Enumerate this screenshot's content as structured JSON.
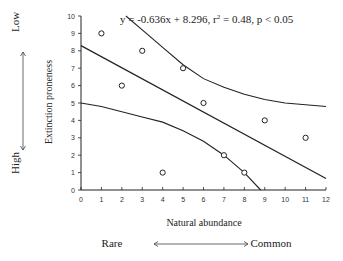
{
  "chart_data": {
    "type": "scatter",
    "title": "",
    "xlabel": "Natural abundance",
    "ylabel": "Extinction proneness",
    "xlim": [
      0,
      12
    ],
    "ylim": [
      0,
      10
    ],
    "xticks": [
      0,
      1,
      2,
      3,
      4,
      5,
      6,
      7,
      8,
      9,
      10,
      11,
      12
    ],
    "yticks": [
      0,
      1,
      2,
      3,
      4,
      5,
      6,
      7,
      8,
      9,
      10
    ],
    "grid": false,
    "points": [
      {
        "x": 1,
        "y": 9
      },
      {
        "x": 2,
        "y": 6
      },
      {
        "x": 3,
        "y": 8
      },
      {
        "x": 4,
        "y": 1
      },
      {
        "x": 5,
        "y": 7
      },
      {
        "x": 6,
        "y": 5
      },
      {
        "x": 7,
        "y": 2
      },
      {
        "x": 8,
        "y": 1
      },
      {
        "x": 9,
        "y": 4
      },
      {
        "x": 11,
        "y": 3
      }
    ],
    "regression": {
      "slope": -0.636,
      "intercept": 8.296,
      "r2": 0.48,
      "p": "< 0.05"
    },
    "confidence_upper": [
      [
        2.2,
        10
      ],
      [
        3,
        9.2
      ],
      [
        4,
        8.2
      ],
      [
        5,
        7.2
      ],
      [
        6,
        6.4
      ],
      [
        7,
        5.9
      ],
      [
        8,
        5.5
      ],
      [
        9,
        5.2
      ],
      [
        10,
        5.0
      ],
      [
        11,
        4.9
      ],
      [
        12,
        4.8
      ]
    ],
    "confidence_lower": [
      [
        0,
        5.0
      ],
      [
        1,
        4.8
      ],
      [
        2,
        4.5
      ],
      [
        3,
        4.2
      ],
      [
        4,
        3.9
      ],
      [
        5,
        3.4
      ],
      [
        6,
        2.8
      ],
      [
        7,
        2.0
      ],
      [
        8,
        1.0
      ],
      [
        8.8,
        0
      ]
    ],
    "annotation": "y = -0.636x + 8.296, r² = 0.48, p < 0.05"
  },
  "labels": {
    "y_top": "Low",
    "y_bottom": "High",
    "x_left": "Rare",
    "x_right": "Common",
    "x_axis": "Natural abundance",
    "y_axis": "Extinction proneness"
  }
}
